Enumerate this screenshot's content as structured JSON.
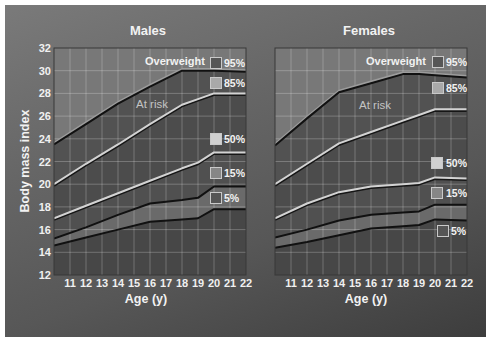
{
  "page": {
    "y_axis_label": "Body mass index"
  },
  "panels": [
    {
      "title": "Males",
      "x_axis_label": "Age (y)",
      "zone_labels": {
        "overweight": "Overweight",
        "at_risk": "At risk"
      },
      "legend": [
        {
          "label": "95%",
          "swatch": "#565656"
        },
        {
          "label": "85%",
          "swatch": "#a9a9a9"
        },
        {
          "label": "50%",
          "swatch": "#d0d0d0"
        },
        {
          "label": "15%",
          "swatch": "#868686"
        },
        {
          "label": "5%",
          "swatch": "#555555"
        }
      ]
    },
    {
      "title": "Females",
      "x_axis_label": "Age (y)",
      "zone_labels": {
        "overweight": "Overweight",
        "at_risk": "At risk"
      },
      "legend": [
        {
          "label": "95%",
          "swatch": "#565656"
        },
        {
          "label": "85%",
          "swatch": "#a9a9a9"
        },
        {
          "label": "50%",
          "swatch": "#d0d0d0"
        },
        {
          "label": "15%",
          "swatch": "#868686"
        },
        {
          "label": "5%",
          "swatch": "#555555"
        }
      ]
    }
  ],
  "style": {
    "band_fills": [
      "#787878",
      "#525252",
      "#4c4c4c",
      "#505050",
      "#6a6a6a",
      "#474747"
    ],
    "grid": "rgba(255,255,255,0.24)",
    "frame": "#383838",
    "lines": [
      {
        "series": "95%",
        "color": "#111111",
        "width": 2,
        "shade": "#9c9c9c",
        "shade_dy": -1.6
      },
      {
        "series": "85%",
        "color": "#d3d3d3",
        "width": 2,
        "shade": "#161616",
        "shade_dy": 1.6
      },
      {
        "series": "50%",
        "color": "#d3d3d3",
        "width": 2,
        "shade": "#161616",
        "shade_dy": 1.6
      },
      {
        "series": "15%",
        "color": "#111111",
        "width": 2,
        "shade": null,
        "shade_dy": 0
      },
      {
        "series": "5%",
        "color": "#111111",
        "width": 2,
        "shade": null,
        "shade_dy": 0
      }
    ]
  },
  "chart_data": [
    {
      "type": "line",
      "title": "Males",
      "xlabel": "Age (y)",
      "ylabel": "Body mass index",
      "xlim": [
        10,
        22
      ],
      "ylim": [
        12,
        32
      ],
      "x_ticks": [
        11,
        12,
        13,
        14,
        15,
        16,
        17,
        18,
        19,
        20,
        21,
        22
      ],
      "y_ticks": [
        12,
        14,
        16,
        18,
        20,
        22,
        24,
        26,
        28,
        30,
        32
      ],
      "y_tick_labels_visible": true,
      "grid": true,
      "legend_position": "inside right",
      "annotations": [
        {
          "text": "Overweight",
          "region": "above 95th percentile"
        },
        {
          "text": "At risk",
          "region": "between 85th and 95th percentile"
        }
      ],
      "x": [
        10,
        12,
        14,
        16,
        18,
        19,
        20,
        22
      ],
      "series": [
        {
          "name": "95%",
          "values": [
            23.5,
            25.3,
            27.1,
            28.6,
            30.0,
            30.0,
            30.0,
            29.9
          ]
        },
        {
          "name": "85%",
          "values": [
            20.0,
            21.8,
            23.5,
            25.3,
            27.0,
            27.5,
            28.0,
            28.0
          ]
        },
        {
          "name": "50%",
          "values": [
            17.0,
            18.1,
            19.2,
            20.3,
            21.4,
            21.9,
            22.8,
            22.8
          ]
        },
        {
          "name": "15%",
          "values": [
            15.2,
            16.2,
            17.3,
            18.3,
            18.6,
            18.8,
            19.8,
            19.8
          ]
        },
        {
          "name": "5%",
          "values": [
            14.6,
            15.3,
            16.0,
            16.7,
            16.9,
            17.0,
            17.8,
            17.8
          ]
        }
      ]
    },
    {
      "type": "line",
      "title": "Females",
      "xlabel": "Age (y)",
      "ylabel": "Body mass index",
      "xlim": [
        10,
        22
      ],
      "ylim": [
        12,
        32
      ],
      "x_ticks": [
        11,
        12,
        13,
        14,
        15,
        16,
        17,
        18,
        19,
        20,
        21,
        22
      ],
      "y_ticks": [
        12,
        14,
        16,
        18,
        20,
        22,
        24,
        26,
        28,
        30,
        32
      ],
      "y_tick_labels_visible": false,
      "grid": true,
      "legend_position": "inside right",
      "annotations": [
        {
          "text": "Overweight",
          "region": "above 95th percentile"
        },
        {
          "text": "At risk",
          "region": "between 85th and 95th percentile"
        }
      ],
      "x": [
        10,
        12,
        14,
        16,
        18,
        19,
        20,
        22
      ],
      "series": [
        {
          "name": "95%",
          "values": [
            23.4,
            25.8,
            28.1,
            28.9,
            29.7,
            29.7,
            29.6,
            29.4
          ]
        },
        {
          "name": "85%",
          "values": [
            20.0,
            21.8,
            23.6,
            24.6,
            25.6,
            26.1,
            26.6,
            26.6
          ]
        },
        {
          "name": "50%",
          "values": [
            17.0,
            18.3,
            19.3,
            19.8,
            20.0,
            20.1,
            20.6,
            20.5
          ]
        },
        {
          "name": "15%",
          "values": [
            15.3,
            16.0,
            16.8,
            17.3,
            17.5,
            17.6,
            18.2,
            18.2
          ]
        },
        {
          "name": "5%",
          "values": [
            14.4,
            14.9,
            15.5,
            16.1,
            16.3,
            16.4,
            16.9,
            16.8
          ]
        }
      ]
    }
  ]
}
